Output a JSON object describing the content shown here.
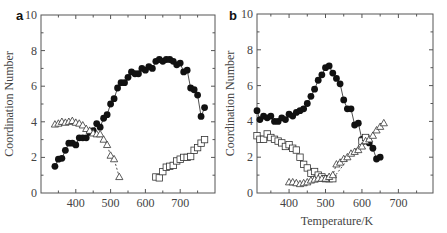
{
  "chart_data": [
    {
      "panel": "a",
      "type": "scatter",
      "title": "",
      "xlabel": "",
      "ylabel": "Coordination Number",
      "xlim": [
        300,
        800
      ],
      "ylim": [
        0,
        10
      ],
      "xticks": [
        400,
        500,
        600,
        700
      ],
      "yticks": [
        0,
        2,
        4,
        6,
        8,
        10
      ],
      "grid": false,
      "series": [
        {
          "name": "filled-circles",
          "marker": "circle-filled",
          "line": "solid",
          "x": [
            340,
            350,
            360,
            370,
            380,
            390,
            400,
            410,
            420,
            430,
            440,
            450,
            460,
            470,
            480,
            490,
            500,
            510,
            520,
            530,
            540,
            550,
            560,
            570,
            580,
            590,
            600,
            610,
            620,
            630,
            640,
            650,
            660,
            670,
            680,
            690,
            700,
            710,
            720,
            730,
            740,
            750,
            760,
            770
          ],
          "y": [
            1.5,
            1.9,
            1.95,
            2.4,
            2.8,
            2.8,
            2.7,
            3.1,
            3.1,
            3.1,
            3.4,
            3.5,
            3.9,
            3.7,
            4.2,
            4.4,
            5.0,
            5.3,
            5.9,
            6.2,
            6.2,
            6.5,
            6.8,
            6.7,
            6.7,
            7.0,
            6.9,
            7.1,
            7.0,
            7.4,
            7.5,
            7.4,
            7.5,
            7.5,
            7.4,
            7.2,
            7.3,
            6.8,
            6.9,
            5.9,
            5.8,
            5.5,
            4.3,
            4.8
          ]
        },
        {
          "name": "open-triangles",
          "marker": "triangle-open",
          "line": "dashed",
          "x": [
            340,
            350,
            360,
            370,
            380,
            390,
            400,
            410,
            420,
            430,
            440,
            450,
            460,
            470,
            480,
            490,
            500,
            510,
            525
          ],
          "y": [
            3.85,
            3.9,
            4.0,
            3.95,
            4.0,
            4.05,
            3.95,
            3.9,
            3.8,
            3.6,
            3.5,
            3.35,
            3.3,
            3.3,
            3.0,
            2.7,
            2.1,
            1.9,
            0.9
          ]
        },
        {
          "name": "open-squares",
          "marker": "square-open",
          "line": "none",
          "x": [
            630,
            640,
            650,
            660,
            670,
            680,
            690,
            700,
            710,
            720,
            730,
            740,
            750,
            760,
            770
          ],
          "y": [
            0.9,
            0.85,
            1.2,
            1.45,
            1.5,
            1.55,
            1.8,
            1.9,
            2.0,
            2.0,
            2.05,
            2.4,
            2.55,
            2.8,
            3.0
          ]
        }
      ]
    },
    {
      "panel": "b",
      "type": "scatter",
      "title": "",
      "xlabel": "Temperature / K",
      "ylabel": "Coordination Number",
      "xlim": [
        312,
        795
      ],
      "ylim": [
        0,
        10
      ],
      "xticks": [
        400,
        500,
        600,
        700
      ],
      "yticks": [
        0,
        2,
        4,
        6,
        8,
        10
      ],
      "grid": false,
      "series": [
        {
          "name": "filled-circles",
          "marker": "circle-filled",
          "line": "solid",
          "x": [
            312,
            320,
            330,
            340,
            350,
            360,
            370,
            380,
            390,
            400,
            410,
            420,
            430,
            440,
            450,
            460,
            470,
            480,
            490,
            500,
            510,
            520,
            530,
            540,
            550,
            560,
            570,
            580,
            590,
            600,
            610,
            620,
            630,
            640,
            650
          ],
          "y": [
            4.6,
            4.1,
            4.3,
            4.2,
            4.3,
            4.0,
            4.0,
            4.2,
            4.1,
            4.4,
            4.3,
            4.5,
            4.6,
            4.7,
            5.0,
            5.4,
            5.8,
            6.3,
            6.6,
            7.0,
            7.1,
            6.7,
            6.4,
            6.1,
            5.2,
            4.7,
            4.7,
            3.8,
            3.9,
            3.0,
            3.0,
            2.8,
            2.5,
            1.9,
            2.0
          ]
        },
        {
          "name": "open-squares",
          "marker": "square-open",
          "line": "dashed",
          "x": [
            312,
            320,
            330,
            340,
            350,
            360,
            370,
            380,
            390,
            400,
            410,
            420,
            430,
            440,
            450,
            460,
            470,
            480,
            490,
            500,
            510,
            520,
            600,
            610
          ],
          "y": [
            3.2,
            3.0,
            3.0,
            3.3,
            3.1,
            3.0,
            2.9,
            2.8,
            2.6,
            2.7,
            2.5,
            2.4,
            2.0,
            1.6,
            1.4,
            1.1,
            1.2,
            1.0,
            0.9,
            0.8,
            0.8,
            0.8,
            2.9,
            3.1
          ]
        },
        {
          "name": "open-triangles",
          "marker": "triangle-open",
          "line": "dashed",
          "x": [
            400,
            410,
            420,
            430,
            440,
            450,
            460,
            470,
            480,
            490,
            500,
            510,
            520,
            530,
            540,
            550,
            560,
            570,
            580,
            590,
            600,
            610,
            620,
            630,
            640,
            650,
            660
          ],
          "y": [
            0.6,
            0.6,
            0.55,
            0.5,
            0.55,
            0.6,
            0.7,
            0.75,
            0.8,
            0.8,
            0.8,
            0.9,
            1.0,
            1.6,
            1.7,
            1.9,
            2.0,
            2.2,
            2.3,
            2.4,
            2.6,
            2.9,
            3.0,
            3.2,
            3.5,
            3.7,
            3.9
          ]
        }
      ]
    }
  ],
  "panels": {
    "a": {
      "label": "a",
      "ylabel": "Coordination Number",
      "xlabel": ""
    },
    "b": {
      "label": "b",
      "ylabel": "Coordination Number",
      "xlabel": "Temperature / K"
    }
  }
}
